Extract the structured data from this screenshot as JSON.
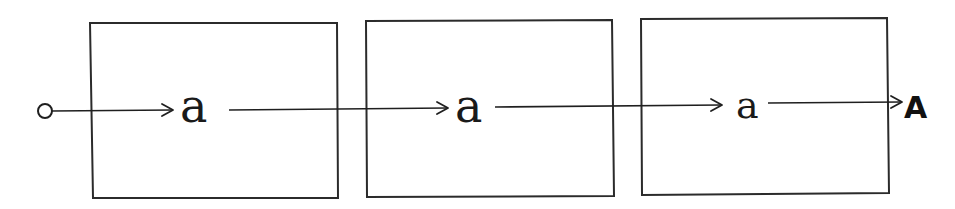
{
  "diagram": {
    "type": "sequential-state-chain",
    "start_node": {
      "shape": "open-circle",
      "icon": "start-circle-icon"
    },
    "boxes": [
      {
        "id": "box-1",
        "label": "a"
      },
      {
        "id": "box-2",
        "label": "a"
      },
      {
        "id": "box-3",
        "label": "a"
      }
    ],
    "output": {
      "label": "A"
    },
    "edges": [
      {
        "from": "start",
        "to": "box-1-label"
      },
      {
        "from": "box-1-label",
        "to": "box-2-label"
      },
      {
        "from": "box-2-label",
        "to": "box-3-label"
      },
      {
        "from": "box-3-label",
        "to": "output"
      }
    ],
    "colors": {
      "stroke": "#2b2b2b",
      "text": "#1a1a1a",
      "background": "#ffffff"
    }
  }
}
